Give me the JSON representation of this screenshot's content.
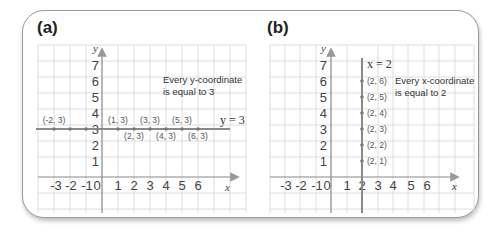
{
  "panels": [
    {
      "label": "(a)",
      "equation": "y = 3",
      "note_line1": "Every y-coordinate",
      "note_line2": "is equal to 3",
      "x_axis_label": "x",
      "y_axis_label": "y",
      "x_ticks": [
        "-3",
        "-2",
        "-1",
        "0",
        "1",
        "2",
        "3",
        "4",
        "5",
        "6"
      ],
      "y_ticks": [
        "1",
        "2",
        "3",
        "4",
        "5",
        "6",
        "7"
      ],
      "points": [
        "(-2, 3)",
        "(1, 3)",
        "(2, 3)",
        "(3, 3)",
        "(4, 3)",
        "(5, 3)",
        "(6, 3)"
      ]
    },
    {
      "label": "(b)",
      "equation": "x = 2",
      "note_line1": "Every x-coordinate",
      "note_line2": "is equal to 2",
      "x_axis_label": "x",
      "y_axis_label": "y",
      "x_ticks": [
        "-3",
        "-2",
        "-1",
        "0",
        "1",
        "2",
        "3",
        "4",
        "5",
        "6"
      ],
      "y_ticks": [
        "1",
        "2",
        "3",
        "4",
        "5",
        "6",
        "7"
      ],
      "points": [
        "(2, 1)",
        "(2, 2)",
        "(2, 3)",
        "(2, 4)",
        "(2, 5)",
        "(2, 6)"
      ]
    }
  ],
  "colors": {
    "grid": "#dddddd",
    "axis": "#888888",
    "line": "#8a8a8a",
    "frame": "#9a9a9a"
  }
}
